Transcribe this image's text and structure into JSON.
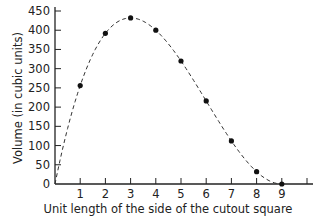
{
  "chart_data": {
    "type": "scatter",
    "title": "",
    "xlabel": "Unit length of the side of the cutout square",
    "ylabel": "Volume (in cubic units)",
    "x": [
      1,
      2,
      3,
      4,
      5,
      6,
      7,
      8,
      9
    ],
    "values": [
      256,
      392,
      432,
      400,
      320,
      216,
      112,
      32,
      0
    ],
    "series": [
      {
        "name": "data points",
        "x": [
          1,
          2,
          3,
          4,
          5,
          6,
          7,
          8,
          9
        ],
        "values": [
          256,
          392,
          432,
          400,
          320,
          216,
          112,
          32,
          0
        ],
        "style": "filled black dots"
      },
      {
        "name": "fitted curve",
        "style": "dashed",
        "function": "x*(18-2x)^2",
        "x_range": [
          0,
          9
        ]
      }
    ],
    "xticks": [
      "1",
      "2",
      "3",
      "4",
      "5",
      "6",
      "7",
      "8",
      "9"
    ],
    "yticks": [
      "0",
      "50",
      "100",
      "150",
      "200",
      "250",
      "300",
      "350",
      "400",
      "450"
    ],
    "xlim": [
      0,
      10
    ],
    "ylim": [
      0,
      450
    ],
    "grid": false,
    "legend": null
  }
}
